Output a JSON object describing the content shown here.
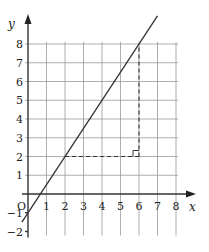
{
  "chart_data": {
    "type": "line",
    "title": "",
    "xlabel": "x",
    "ylabel": "y",
    "origin_label": "O",
    "xlim": [
      -1,
      8.5
    ],
    "ylim": [
      -2,
      9.5
    ],
    "grid": true,
    "x_ticks": [
      1,
      2,
      3,
      4,
      5,
      6,
      7,
      8
    ],
    "y_ticks": [
      -2,
      -1,
      1,
      2,
      3,
      4,
      5,
      6,
      7,
      8
    ],
    "series": [
      {
        "name": "line",
        "equation": "y = 1.5x - 1",
        "x": [
          -0.33,
          7.0
        ],
        "y": [
          -1.5,
          9.5
        ]
      }
    ],
    "annotations": [
      {
        "type": "dashed-horizontal",
        "from": [
          2,
          2
        ],
        "to": [
          6,
          2
        ]
      },
      {
        "type": "dashed-vertical",
        "from": [
          6,
          2
        ],
        "to": [
          6,
          8
        ]
      },
      {
        "type": "right-angle-marker",
        "at": [
          6,
          2
        ]
      }
    ],
    "colors": {
      "grid": "#9a9a9a",
      "axis": "#333333",
      "line": "#333333"
    }
  }
}
